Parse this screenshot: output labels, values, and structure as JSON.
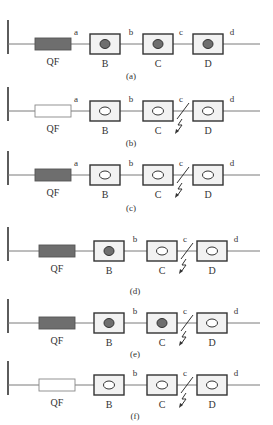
{
  "figure": {
    "top_cutoff_text": "",
    "colors": {
      "line": "#7a7a7a",
      "box_stroke": "#333333",
      "box_fill": "#f2f2f2",
      "filled": "#6e6e6e",
      "open_fill": "#ffffff",
      "bus": "#333333",
      "text": "#333333"
    },
    "node_labels": {
      "breaker": "QF",
      "B": "B",
      "C": "C",
      "D": "D"
    },
    "panels": [
      {
        "id": "a",
        "caption": "(a)",
        "line_y": 44,
        "caption_y": 79,
        "qf_filled": true,
        "B_filled": true,
        "C_filled": true,
        "D_filled": true,
        "fault": false,
        "points": [
          "a",
          "b",
          "c",
          "d"
        ]
      },
      {
        "id": "b",
        "caption": "(b)",
        "line_y": 111,
        "caption_y": 146,
        "qf_filled": false,
        "B_filled": false,
        "C_filled": false,
        "D_filled": false,
        "fault": true,
        "points": [
          "a",
          "b",
          "c",
          "d"
        ]
      },
      {
        "id": "c",
        "caption": "(c)",
        "line_y": 175,
        "caption_y": 211,
        "qf_filled": true,
        "B_filled": false,
        "C_filled": false,
        "D_filled": false,
        "fault": true,
        "points": [
          "a",
          "b",
          "c",
          "d"
        ]
      },
      {
        "id": "d",
        "caption": "(d)",
        "line_y": 251,
        "caption_y": 294,
        "qf_filled": true,
        "B_filled": true,
        "C_filled": false,
        "D_filled": false,
        "fault": true,
        "points": [
          "",
          "b",
          "c",
          "d"
        ]
      },
      {
        "id": "e",
        "caption": "(e)",
        "line_y": 323,
        "caption_y": 357,
        "qf_filled": true,
        "B_filled": true,
        "C_filled": true,
        "D_filled": false,
        "fault": true,
        "points": [
          "",
          "b",
          "c",
          "d"
        ]
      },
      {
        "id": "f",
        "caption": "(f)",
        "line_y": 385,
        "caption_y": 419,
        "qf_filled": false,
        "B_filled": false,
        "C_filled": false,
        "D_filled": false,
        "fault": true,
        "points": [
          "",
          "b",
          "c",
          "d"
        ]
      }
    ]
  }
}
